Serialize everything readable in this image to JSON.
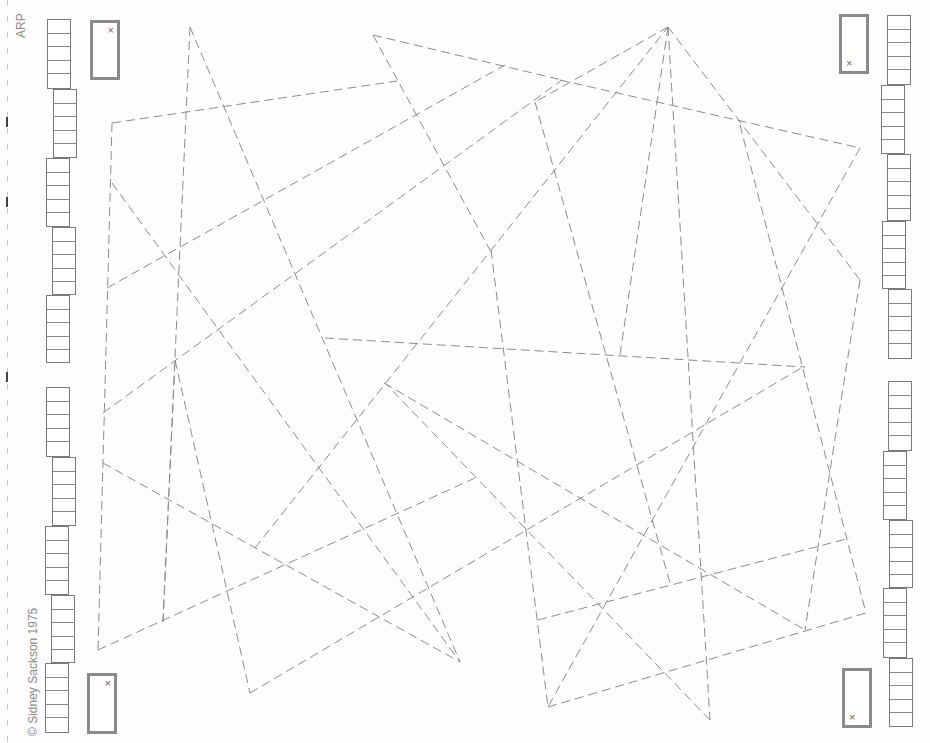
{
  "board": {
    "title": "ARP",
    "copyright": "© Sidney Sackson 1975",
    "line_color": "#8c8c8c",
    "background": "#fdfdfd"
  },
  "markers": [
    {
      "id": "top-left",
      "symbol": "×"
    },
    {
      "id": "bottom-left",
      "symbol": "×"
    },
    {
      "id": "top-right",
      "symbol": "×"
    },
    {
      "id": "bottom-right",
      "symbol": "×"
    }
  ],
  "score_tracks": {
    "left": {
      "stacks": 10,
      "cells_per_stack": 5
    },
    "right": {
      "stacks": 10,
      "cells_per_stack": 5
    }
  },
  "lines": [
    [
      190,
      27,
      460,
      662
    ],
    [
      190,
      27,
      163,
      622
    ],
    [
      373,
      35,
      562,
      80
    ],
    [
      373,
      35,
      490,
      250
    ],
    [
      112,
      123,
      397,
      81
    ],
    [
      112,
      123,
      98,
      650
    ],
    [
      107,
      288,
      505,
      65
    ],
    [
      112,
      183,
      460,
      662
    ],
    [
      103,
      413,
      562,
      80
    ],
    [
      103,
      463,
      460,
      662
    ],
    [
      98,
      650,
      475,
      478
    ],
    [
      163,
      622,
      175,
      360
    ],
    [
      175,
      360,
      250,
      693
    ],
    [
      250,
      693,
      803,
      367
    ],
    [
      668,
      27,
      535,
      102
    ],
    [
      668,
      27,
      620,
      355
    ],
    [
      668,
      27,
      860,
      280
    ],
    [
      535,
      102,
      670,
      583
    ],
    [
      255,
      548,
      668,
      27
    ],
    [
      491,
      250,
      548,
      707
    ],
    [
      560,
      80,
      860,
      148
    ],
    [
      860,
      148,
      548,
      707
    ],
    [
      860,
      280,
      805,
      630
    ],
    [
      740,
      125,
      866,
      613
    ],
    [
      325,
      338,
      805,
      367
    ],
    [
      384,
      383,
      805,
      630
    ],
    [
      548,
      707,
      866,
      613
    ],
    [
      538,
      620,
      850,
      538
    ],
    [
      668,
      27,
      710,
      720
    ],
    [
      710,
      720,
      385,
      383
    ]
  ]
}
